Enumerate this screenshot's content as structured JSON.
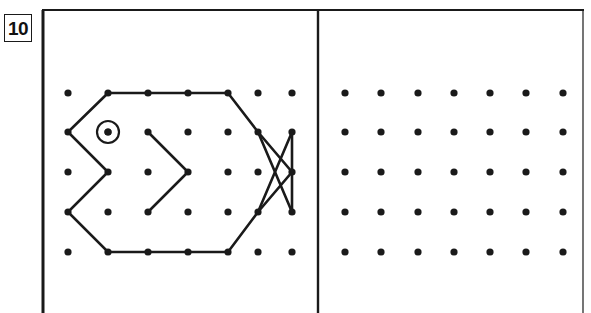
{
  "page": {
    "width": 591,
    "height": 313,
    "background": "#ffffff",
    "ink_color": "#1a1a1a"
  },
  "question": {
    "number_label": "10",
    "box_name": "question-number-box"
  },
  "frame": {
    "top_rule": {
      "x1": 42,
      "y1": 10,
      "x2": 584,
      "y2": 10,
      "width": 2
    },
    "left_rule": {
      "x1": 43,
      "y1": 10,
      "x2": 43,
      "y2": 313,
      "width": 3
    },
    "right_rule": {
      "x1": 583,
      "y1": 10,
      "x2": 583,
      "y2": 313,
      "width": 1.2
    },
    "divider_rule": {
      "x1": 318,
      "y1": 10,
      "x2": 318,
      "y2": 313,
      "width": 2.4
    }
  },
  "grids": {
    "left": {
      "name": "left-dot-grid",
      "columns": 7,
      "rows": 5,
      "x_positions": [
        68,
        108,
        148,
        188,
        228,
        258,
        292
      ],
      "y_positions": [
        93,
        132,
        172,
        212,
        252
      ],
      "dot_radius": 3.6,
      "dot_color": "#1a1a1a"
    },
    "right": {
      "name": "right-dot-grid",
      "columns": 7,
      "rows": 5,
      "x_positions": [
        345,
        381,
        418,
        454,
        490,
        526,
        563
      ],
      "y_positions": [
        93,
        132,
        172,
        212,
        252
      ],
      "dot_radius": 3.6,
      "dot_color": "#1a1a1a"
    }
  },
  "figure": {
    "name": "fish-figure",
    "stroke_color": "#1a1a1a",
    "stroke_width": 2.6,
    "polylines": [
      {
        "name": "fish-body-outline",
        "points": "108,93 148,93 188,93 228,93 258,132 292,172 258,212 228,252 188,252 148,252 108,252 68,212 108,172 68,132 108,93"
      },
      {
        "name": "fish-inner-chevron",
        "points": "148,132 188,172 148,212"
      },
      {
        "name": "fish-tail-stroke-a",
        "points": "258,132 292,212"
      },
      {
        "name": "fish-tail-stroke-b",
        "points": "258,212 292,132"
      },
      {
        "name": "fish-tail-vertical",
        "points": "292,132 292,212"
      }
    ],
    "eye": {
      "name": "fish-eye",
      "cx": 108,
      "cy": 132,
      "outer_radius": 11,
      "stroke_width": 2.2
    }
  }
}
